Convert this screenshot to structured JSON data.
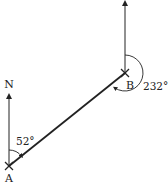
{
  "diagram": {
    "type": "bearing",
    "points": {
      "A": {
        "label": "A",
        "x": 9,
        "y": 166
      },
      "B": {
        "label": "B",
        "x": 125,
        "y": 73
      }
    },
    "north_label": "N",
    "angles": {
      "at_A": {
        "value": "52°"
      },
      "at_B": {
        "value": "232°"
      }
    },
    "colors": {
      "line": "#222222",
      "background": "#ffffff"
    }
  }
}
